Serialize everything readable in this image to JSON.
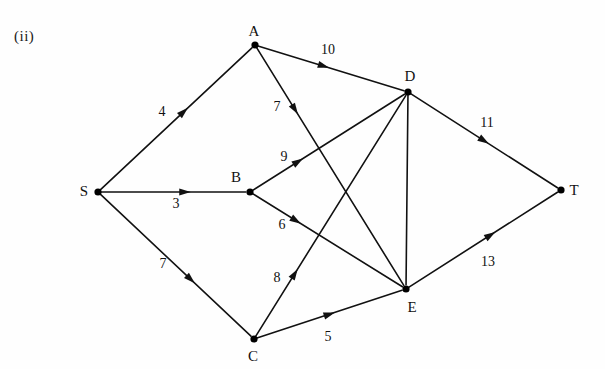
{
  "figure": {
    "caption": "(ii)",
    "caption_x": 14,
    "caption_y": 36
  },
  "style": {
    "edge_color": "#111111",
    "node_color": "#000000",
    "background": "#fefefe",
    "node_radius": 3.6,
    "edge_width": 1.6
  },
  "chart_data": {
    "type": "diagram",
    "subtype": "directed-weighted-network",
    "title": "(ii)",
    "nodes": [
      {
        "id": "S",
        "label": "S",
        "x": 98,
        "y": 192,
        "label_x": 84,
        "label_y": 191
      },
      {
        "id": "A",
        "label": "A",
        "x": 255,
        "y": 45,
        "label_x": 254,
        "label_y": 31
      },
      {
        "id": "B",
        "label": "B",
        "x": 250,
        "y": 192,
        "label_x": 236,
        "label_y": 177
      },
      {
        "id": "C",
        "label": "C",
        "x": 254,
        "y": 339,
        "label_x": 253,
        "label_y": 356
      },
      {
        "id": "D",
        "label": "D",
        "x": 408,
        "y": 92,
        "label_x": 410,
        "label_y": 76
      },
      {
        "id": "E",
        "label": "E",
        "x": 406,
        "y": 289,
        "label_x": 412,
        "label_y": 307
      },
      {
        "id": "T",
        "label": "T",
        "x": 561,
        "y": 190,
        "label_x": 574,
        "label_y": 190
      }
    ],
    "edges": [
      {
        "from": "S",
        "to": "A",
        "weight": "4",
        "label_x": 162,
        "label_y": 112,
        "arrow_t": 0.55
      },
      {
        "from": "S",
        "to": "B",
        "weight": "3",
        "label_x": 176,
        "label_y": 204,
        "arrow_t": 0.58
      },
      {
        "from": "S",
        "to": "C",
        "weight": "7",
        "label_x": 163,
        "label_y": 264,
        "arrow_t": 0.6
      },
      {
        "from": "A",
        "to": "D",
        "weight": "10",
        "label_x": 328,
        "label_y": 50,
        "arrow_t": 0.45
      },
      {
        "from": "A",
        "to": "E",
        "weight": "7",
        "label_x": 277,
        "label_y": 107,
        "arrow_t": 0.26
      },
      {
        "from": "B",
        "to": "D",
        "weight": "9",
        "label_x": 284,
        "label_y": 157,
        "arrow_t": 0.3
      },
      {
        "from": "B",
        "to": "E",
        "weight": "6",
        "label_x": 282,
        "label_y": 225,
        "arrow_t": 0.29
      },
      {
        "from": "C",
        "to": "D",
        "weight": "8",
        "label_x": 277,
        "label_y": 278,
        "arrow_t": 0.26
      },
      {
        "from": "C",
        "to": "E",
        "weight": "5",
        "label_x": 328,
        "label_y": 337,
        "arrow_t": 0.5
      },
      {
        "from": "D",
        "to": "E",
        "weight": "",
        "label_x": 0,
        "label_y": 0,
        "arrow_t": 0.0
      },
      {
        "from": "D",
        "to": "T",
        "weight": "11",
        "label_x": 487,
        "label_y": 123,
        "arrow_t": 0.5
      },
      {
        "from": "E",
        "to": "T",
        "weight": "13",
        "label_x": 488,
        "label_y": 262,
        "arrow_t": 0.55
      }
    ],
    "node_count": 7,
    "edge_count": 12,
    "source_node": "S",
    "sink_node": "T"
  }
}
